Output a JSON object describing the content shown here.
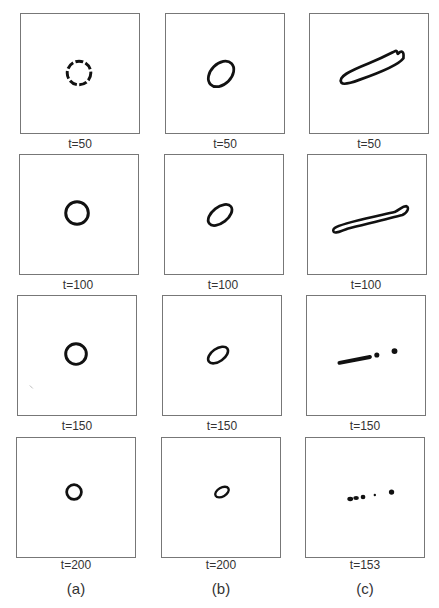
{
  "figure": {
    "columns": [
      {
        "label": "(a)",
        "frames": [
          {
            "t": "t=50",
            "shape": "dashed-circle"
          },
          {
            "t": "t=100",
            "shape": "circle"
          },
          {
            "t": "t=150",
            "shape": "circle"
          },
          {
            "t": "t=200",
            "shape": "circle-small"
          }
        ]
      },
      {
        "label": "(b)",
        "frames": [
          {
            "t": "t=50",
            "shape": "ellipse-tilted"
          },
          {
            "t": "t=100",
            "shape": "ellipse-tilted"
          },
          {
            "t": "t=150",
            "shape": "ellipse-tilted-small"
          },
          {
            "t": "t=200",
            "shape": "ellipse-tilted-smaller"
          }
        ]
      },
      {
        "label": "(c)",
        "frames": [
          {
            "t": "t=50",
            "shape": "elongated-loop"
          },
          {
            "t": "t=100",
            "shape": "thin-elongated-loop"
          },
          {
            "t": "t=150",
            "shape": "fragmented-line-with-droplets"
          },
          {
            "t": "t=153",
            "shape": "droplets"
          }
        ]
      }
    ]
  }
}
